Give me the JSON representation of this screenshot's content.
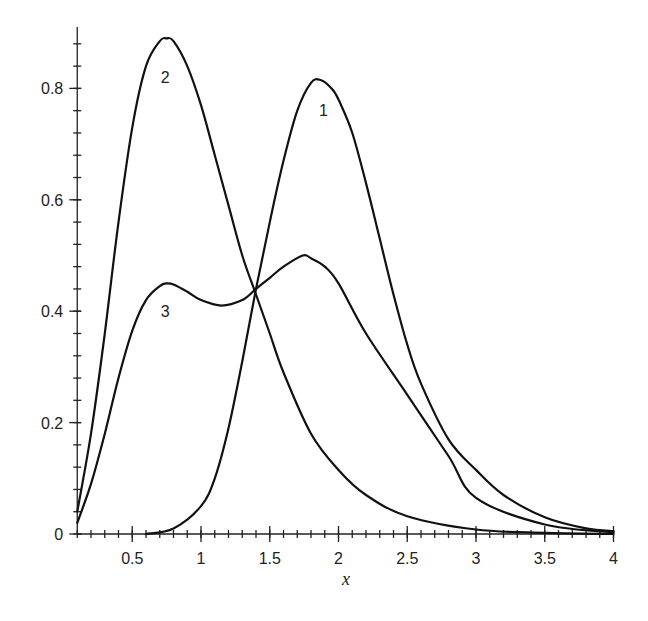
{
  "chart_data": {
    "type": "line",
    "title": "",
    "xlabel": "x",
    "ylabel": "",
    "xlim": [
      0.1,
      4
    ],
    "ylim": [
      0,
      0.92
    ],
    "grid": false,
    "legend": "none (curves labeled inline)",
    "x_ticks": [
      {
        "value": 0.5,
        "label": "0.5"
      },
      {
        "value": 1,
        "label": "1"
      },
      {
        "value": 1.5,
        "label": "1.5"
      },
      {
        "value": 2,
        "label": "2"
      },
      {
        "value": 2.5,
        "label": "2.5"
      },
      {
        "value": 3,
        "label": "3"
      },
      {
        "value": 3.5,
        "label": "3.5"
      },
      {
        "value": 4,
        "label": "4"
      }
    ],
    "x_minor_step": 0.1,
    "y_ticks": [
      {
        "value": 0,
        "label": "0"
      },
      {
        "value": 0.2,
        "label": "0.2"
      },
      {
        "value": 0.4,
        "label": "0.4"
      },
      {
        "value": 0.6,
        "label": "0.6"
      },
      {
        "value": 0.8,
        "label": "0.8"
      }
    ],
    "y_minor_step": 0.04,
    "series": [
      {
        "name": "1",
        "label_pos": [
          1.89,
          0.75
        ],
        "x": [
          0.6,
          0.8,
          1.0,
          1.1,
          1.2,
          1.3,
          1.4,
          1.5,
          1.6,
          1.7,
          1.8,
          1.87,
          1.95,
          2.0,
          2.1,
          2.2,
          2.3,
          2.4,
          2.5,
          2.6,
          2.8,
          3.0,
          3.2,
          3.5,
          3.8,
          4.0
        ],
        "y": [
          0.0,
          0.01,
          0.05,
          0.1,
          0.19,
          0.31,
          0.44,
          0.56,
          0.67,
          0.76,
          0.81,
          0.815,
          0.8,
          0.78,
          0.72,
          0.63,
          0.53,
          0.43,
          0.34,
          0.27,
          0.17,
          0.115,
          0.07,
          0.03,
          0.01,
          0.005
        ]
      },
      {
        "name": "2",
        "label_pos": [
          0.74,
          0.81
        ],
        "x": [
          0.1,
          0.2,
          0.3,
          0.4,
          0.5,
          0.6,
          0.7,
          0.75,
          0.8,
          0.9,
          1.0,
          1.1,
          1.2,
          1.3,
          1.4,
          1.5,
          1.6,
          1.8,
          2.0,
          2.2,
          2.5,
          3.0,
          3.5,
          4.0
        ],
        "y": [
          0.04,
          0.18,
          0.36,
          0.56,
          0.73,
          0.84,
          0.885,
          0.89,
          0.885,
          0.84,
          0.77,
          0.68,
          0.59,
          0.5,
          0.43,
          0.36,
          0.29,
          0.18,
          0.115,
          0.07,
          0.032,
          0.008,
          0.002,
          0.0
        ]
      },
      {
        "name": "3",
        "label_pos": [
          0.74,
          0.39
        ],
        "x": [
          0.1,
          0.2,
          0.3,
          0.4,
          0.5,
          0.6,
          0.7,
          0.75,
          0.8,
          0.9,
          1.0,
          1.15,
          1.3,
          1.4,
          1.5,
          1.6,
          1.74,
          1.8,
          1.9,
          2.0,
          2.2,
          2.5,
          2.8,
          3.0,
          3.5,
          4.0
        ],
        "y": [
          0.02,
          0.09,
          0.18,
          0.28,
          0.365,
          0.42,
          0.445,
          0.45,
          0.448,
          0.435,
          0.42,
          0.41,
          0.42,
          0.44,
          0.46,
          0.48,
          0.5,
          0.495,
          0.48,
          0.45,
          0.36,
          0.25,
          0.14,
          0.065,
          0.017,
          0.003
        ]
      }
    ],
    "annotations": [
      "1",
      "2",
      "3"
    ]
  }
}
